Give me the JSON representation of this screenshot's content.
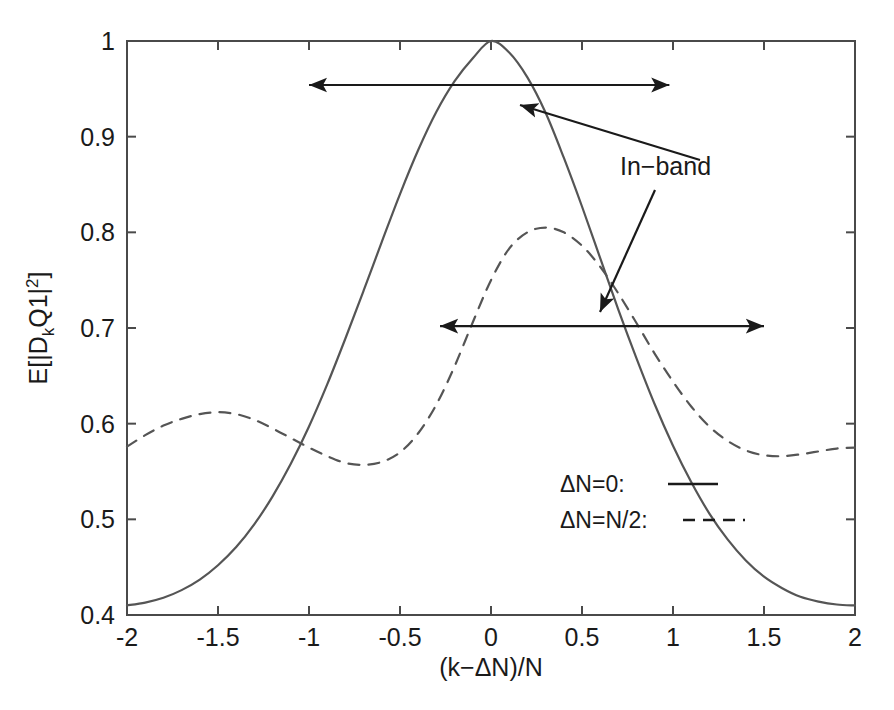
{
  "figure": {
    "background_color": "#ffffff",
    "axis_color": "#4a4a4a",
    "curve_color": "#555555",
    "text_color": "#1a1a1a"
  },
  "axes": {
    "x": {
      "title_parts": {
        "open": "(k",
        "minus": "−",
        "delta": "Δ",
        "n": "N)/N"
      },
      "title": "(k−ΔN)/N",
      "ticks": [
        "-2",
        "-1.5",
        "-1",
        "-0.5",
        "0",
        "0.5",
        "1",
        "1.5",
        "2"
      ],
      "tick_values": [
        -2,
        -1.5,
        -1,
        -0.5,
        0,
        0.5,
        1,
        1.5,
        2
      ],
      "min": -2,
      "max": 2
    },
    "y": {
      "title_parts": {
        "prefix": "E[|D",
        "sub": "k",
        "mid": "Q1|",
        "sup": "2",
        "suffix": "]"
      },
      "title": "E[|D_kQ1|^2]",
      "ticks": [
        "0.4",
        "0.5",
        "0.6",
        "0.7",
        "0.8",
        "0.9",
        "1"
      ],
      "tick_values": [
        0.4,
        0.5,
        0.6,
        0.7,
        0.8,
        0.9,
        1
      ],
      "min": 0.4,
      "max": 1
    }
  },
  "legend": {
    "entries": [
      {
        "label": "ΔN=0:",
        "style": "solid",
        "sample": "—"
      },
      {
        "label": "ΔN=N/2:",
        "style": "dashed",
        "sample": "– – –"
      }
    ]
  },
  "annotations": [
    {
      "name": "in-band-label",
      "text": "In−band",
      "x": 620,
      "y": 175
    }
  ],
  "arrows": [
    {
      "name": "in-band-span-upper",
      "y_value": 0.954,
      "x_start": -1.0,
      "x_end": 0.98,
      "double_headed": true
    },
    {
      "name": "in-band-span-lower",
      "y_value": 0.702,
      "x_start": -0.28,
      "x_end": 1.5,
      "double_headed": true
    },
    {
      "name": "pointer-to-upper-span",
      "from_x": 700,
      "from_y": 160,
      "to_x": 520,
      "to_y": 105,
      "double_headed": false
    },
    {
      "name": "pointer-to-lower-span",
      "from_x": 655,
      "from_y": 190,
      "to_x": 600,
      "to_y": 312,
      "double_headed": false
    }
  ],
  "chart_data": {
    "type": "line",
    "title": "",
    "xlabel": "(k−ΔN)/N",
    "ylabel": "E[|D_kQ1|^2]",
    "xlim": [
      -2,
      2
    ],
    "ylim": [
      0.4,
      1.0
    ],
    "grid": false,
    "legend_position": "inside-lower-right",
    "x": [
      -2.0,
      -1.9,
      -1.8,
      -1.7,
      -1.6,
      -1.5,
      -1.4,
      -1.3,
      -1.2,
      -1.1,
      -1.0,
      -0.9,
      -0.8,
      -0.7,
      -0.6,
      -0.5,
      -0.4,
      -0.3,
      -0.2,
      -0.1,
      0.0,
      0.1,
      0.2,
      0.3,
      0.4,
      0.5,
      0.6,
      0.7,
      0.8,
      0.9,
      1.0,
      1.1,
      1.2,
      1.3,
      1.4,
      1.5,
      1.6,
      1.7,
      1.8,
      1.9,
      2.0
    ],
    "series": [
      {
        "name": "ΔN=0",
        "style": "solid",
        "values": [
          0.41,
          0.413,
          0.418,
          0.426,
          0.437,
          0.452,
          0.471,
          0.495,
          0.524,
          0.558,
          0.597,
          0.641,
          0.689,
          0.739,
          0.79,
          0.84,
          0.886,
          0.926,
          0.958,
          0.982,
          1.0,
          0.988,
          0.962,
          0.925,
          0.878,
          0.827,
          0.773,
          0.719,
          0.668,
          0.62,
          0.577,
          0.539,
          0.506,
          0.479,
          0.457,
          0.44,
          0.428,
          0.419,
          0.414,
          0.411,
          0.41
        ]
      },
      {
        "name": "ΔN=N/2",
        "style": "dashed",
        "values": [
          0.576,
          0.588,
          0.598,
          0.605,
          0.61,
          0.612,
          0.61,
          0.604,
          0.595,
          0.585,
          0.575,
          0.566,
          0.559,
          0.557,
          0.56,
          0.57,
          0.59,
          0.62,
          0.66,
          0.706,
          0.75,
          0.783,
          0.8,
          0.805,
          0.8,
          0.786,
          0.764,
          0.736,
          0.705,
          0.673,
          0.644,
          0.618,
          0.597,
          0.582,
          0.572,
          0.567,
          0.566,
          0.568,
          0.571,
          0.574,
          0.575
        ]
      }
    ]
  }
}
